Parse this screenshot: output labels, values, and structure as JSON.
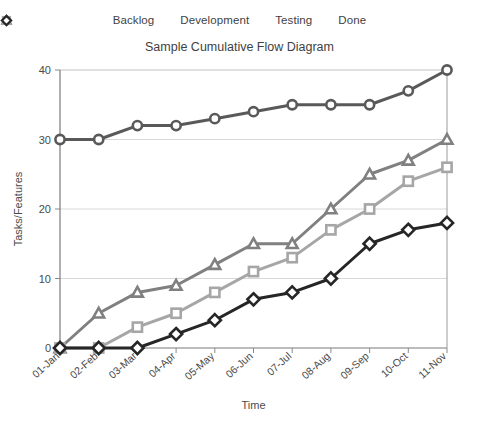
{
  "chart_data": {
    "type": "line",
    "title": "Sample Cumulative Flow Diagram",
    "xlabel": "Time",
    "ylabel": "Tasks/Features",
    "categories": [
      "01-Jan",
      "02-Feb",
      "03-Mar",
      "04-Apr",
      "05-May",
      "06-Jun",
      "07-Jul",
      "08-Aug",
      "09-Sep",
      "10-Oct",
      "11-Nov"
    ],
    "ylim": [
      0,
      40
    ],
    "yticks": [
      0,
      10,
      20,
      30,
      40
    ],
    "grid": true,
    "legend_position": "top",
    "series": [
      {
        "name": "Backlog",
        "marker": "circle",
        "color": "#595959",
        "values": [
          30,
          30,
          32,
          32,
          33,
          34,
          35,
          35,
          35,
          37,
          40
        ]
      },
      {
        "name": "Development",
        "marker": "triangle",
        "color": "#808080",
        "values": [
          0,
          5,
          8,
          9,
          12,
          15,
          15,
          20,
          25,
          27,
          30
        ]
      },
      {
        "name": "Testing",
        "marker": "square",
        "color": "#a6a6a6",
        "values": [
          0,
          0,
          3,
          5,
          8,
          11,
          13,
          17,
          20,
          24,
          26
        ]
      },
      {
        "name": "Done",
        "marker": "diamond",
        "color": "#262626",
        "values": [
          0,
          0,
          0,
          2,
          4,
          7,
          8,
          10,
          15,
          17,
          18
        ]
      }
    ]
  },
  "legend": {
    "items": [
      {
        "label": "Backlog"
      },
      {
        "label": "Development"
      },
      {
        "label": "Testing"
      },
      {
        "label": "Done"
      }
    ]
  }
}
